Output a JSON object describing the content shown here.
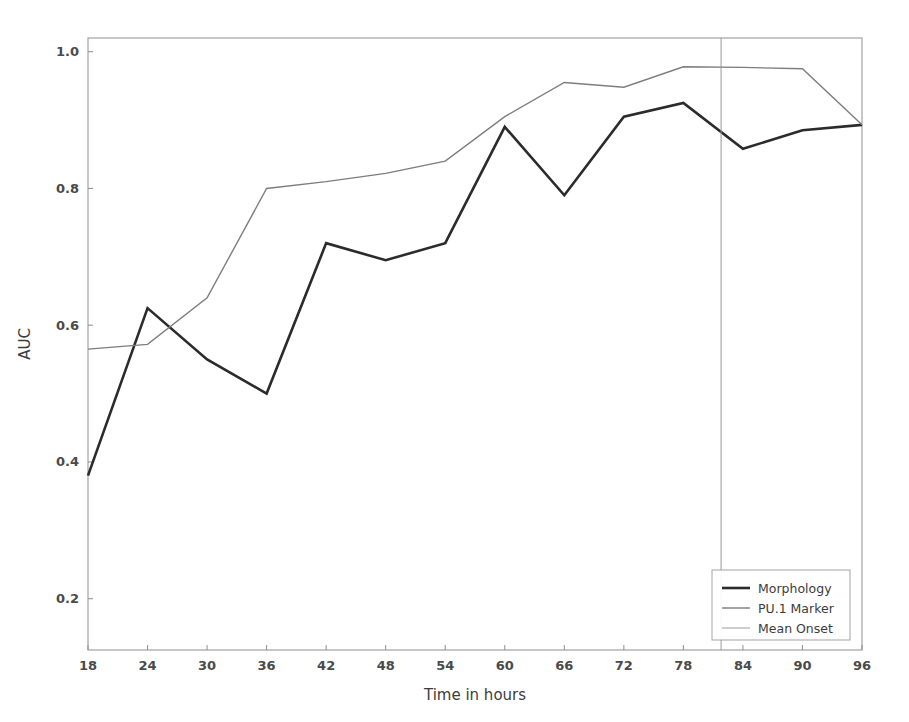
{
  "chart_data": {
    "type": "line",
    "title": "",
    "xlabel": "Time in hours",
    "ylabel": "AUC",
    "x": [
      18,
      24,
      30,
      36,
      42,
      48,
      54,
      60,
      66,
      72,
      78,
      84,
      90,
      96
    ],
    "xticks": [
      18,
      24,
      30,
      36,
      42,
      48,
      54,
      60,
      66,
      72,
      78,
      84,
      90,
      96
    ],
    "yticks": [
      0.2,
      0.4,
      0.6,
      0.8,
      1.0
    ],
    "ytick_labels": [
      "0.2",
      "0.4",
      "0.6",
      "0.8",
      "1.0"
    ],
    "xtick_labels": [
      "18",
      "24",
      "30",
      "36",
      "42",
      "48",
      "54",
      "60",
      "66",
      "72",
      "78",
      "84",
      "90",
      "96"
    ],
    "xlim": [
      18,
      96
    ],
    "ylim": [
      0.125,
      1.02
    ],
    "grid": false,
    "legend_position": "lower right",
    "series": [
      {
        "name": "Morphology",
        "color": "#2b2b2b",
        "width": 2.6,
        "style": "solid",
        "values": [
          0.38,
          0.625,
          0.55,
          0.5,
          0.72,
          0.695,
          0.72,
          0.89,
          0.79,
          0.905,
          0.925,
          0.858,
          0.885,
          0.893
        ]
      },
      {
        "name": "PU.1 Marker",
        "color": "#7d7d7d",
        "width": 1.4,
        "style": "solid",
        "values": [
          0.565,
          0.572,
          0.64,
          0.8,
          0.81,
          0.822,
          0.84,
          0.905,
          0.955,
          0.948,
          0.978,
          0.977,
          0.975,
          0.893
        ]
      },
      {
        "name": "Mean Onset",
        "color": "#9a9a9a",
        "width": 1.0,
        "style": "vline",
        "vline_x": 81.8
      }
    ]
  },
  "legend": {
    "entries": [
      {
        "label": "Morphology"
      },
      {
        "label": "PU.1 Marker"
      },
      {
        "label": "Mean Onset"
      }
    ]
  },
  "axes": {
    "x_title": "Time in hours",
    "y_title": "AUC"
  }
}
